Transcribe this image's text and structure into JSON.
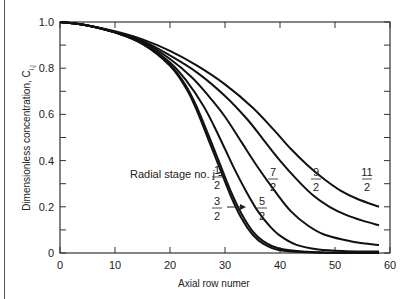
{
  "chart_data": {
    "type": "line",
    "title": "",
    "xlabel": "Axial row numer",
    "ylabel": "Dimensionless concentration, C",
    "ylabel_subscript": "i,j",
    "xlim": [
      0,
      60
    ],
    "ylim": [
      0,
      1.0
    ],
    "x_ticks": [
      "0",
      "10",
      "20",
      "30",
      "40",
      "50",
      "60"
    ],
    "y_ticks": [
      "0",
      "0.2",
      "0.4",
      "0.6",
      "0.8",
      "1.0"
    ],
    "grid": false,
    "legend": "inline annotations",
    "annotation_prefix": "Radial stage no. j =",
    "series": [
      {
        "name": "1/2",
        "num": "1",
        "den": "2",
        "points": [
          [
            0,
            1.0
          ],
          [
            5,
            0.985
          ],
          [
            10,
            0.955
          ],
          [
            15,
            0.905
          ],
          [
            20,
            0.81
          ],
          [
            23,
            0.71
          ],
          [
            25,
            0.61
          ],
          [
            27,
            0.49
          ],
          [
            29,
            0.37
          ],
          [
            31,
            0.25
          ],
          [
            33,
            0.15
          ],
          [
            35,
            0.08
          ],
          [
            37,
            0.04
          ],
          [
            40,
            0.012
          ],
          [
            45,
            0.003
          ],
          [
            50,
            0.0
          ],
          [
            58,
            0.0
          ]
        ]
      },
      {
        "name": "3/2",
        "num": "3",
        "den": "2",
        "points": [
          [
            0,
            1.0
          ],
          [
            5,
            0.985
          ],
          [
            10,
            0.955
          ],
          [
            15,
            0.905
          ],
          [
            20,
            0.815
          ],
          [
            23,
            0.72
          ],
          [
            25,
            0.625
          ],
          [
            27,
            0.51
          ],
          [
            29,
            0.39
          ],
          [
            31,
            0.27
          ],
          [
            33,
            0.17
          ],
          [
            35,
            0.095
          ],
          [
            37,
            0.05
          ],
          [
            40,
            0.018
          ],
          [
            45,
            0.005
          ],
          [
            50,
            0.002
          ],
          [
            58,
            0.0
          ]
        ]
      },
      {
        "name": "5/2",
        "num": "5",
        "den": "2",
        "points": [
          [
            0,
            1.0
          ],
          [
            5,
            0.985
          ],
          [
            10,
            0.955
          ],
          [
            15,
            0.91
          ],
          [
            20,
            0.825
          ],
          [
            23,
            0.745
          ],
          [
            26,
            0.64
          ],
          [
            28,
            0.55
          ],
          [
            30,
            0.45
          ],
          [
            32,
            0.35
          ],
          [
            34,
            0.26
          ],
          [
            36,
            0.18
          ],
          [
            38,
            0.12
          ],
          [
            40,
            0.075
          ],
          [
            43,
            0.035
          ],
          [
            47,
            0.015
          ],
          [
            52,
            0.008
          ],
          [
            58,
            0.006
          ]
        ]
      },
      {
        "name": "7/2",
        "num": "7",
        "den": "2",
        "points": [
          [
            0,
            1.0
          ],
          [
            5,
            0.985
          ],
          [
            10,
            0.955
          ],
          [
            15,
            0.915
          ],
          [
            20,
            0.84
          ],
          [
            24,
            0.76
          ],
          [
            27,
            0.68
          ],
          [
            30,
            0.59
          ],
          [
            33,
            0.48
          ],
          [
            36,
            0.37
          ],
          [
            39,
            0.27
          ],
          [
            42,
            0.18
          ],
          [
            45,
            0.12
          ],
          [
            48,
            0.08
          ],
          [
            52,
            0.055
          ],
          [
            55,
            0.042
          ],
          [
            58,
            0.035
          ]
        ]
      },
      {
        "name": "9/2",
        "num": "9",
        "den": "2",
        "points": [
          [
            0,
            1.0
          ],
          [
            5,
            0.985
          ],
          [
            10,
            0.955
          ],
          [
            15,
            0.918
          ],
          [
            20,
            0.855
          ],
          [
            25,
            0.78
          ],
          [
            30,
            0.68
          ],
          [
            34,
            0.58
          ],
          [
            37,
            0.49
          ],
          [
            40,
            0.4
          ],
          [
            43,
            0.32
          ],
          [
            46,
            0.25
          ],
          [
            49,
            0.2
          ],
          [
            52,
            0.165
          ],
          [
            55,
            0.14
          ],
          [
            58,
            0.12
          ]
        ]
      },
      {
        "name": "11/2",
        "num": "11",
        "den": "2",
        "points": [
          [
            0,
            1.0
          ],
          [
            5,
            0.985
          ],
          [
            10,
            0.96
          ],
          [
            15,
            0.925
          ],
          [
            20,
            0.875
          ],
          [
            25,
            0.81
          ],
          [
            30,
            0.73
          ],
          [
            35,
            0.63
          ],
          [
            39,
            0.53
          ],
          [
            42,
            0.45
          ],
          [
            45,
            0.38
          ],
          [
            48,
            0.32
          ],
          [
            51,
            0.27
          ],
          [
            54,
            0.235
          ],
          [
            58,
            0.2
          ]
        ]
      }
    ]
  }
}
